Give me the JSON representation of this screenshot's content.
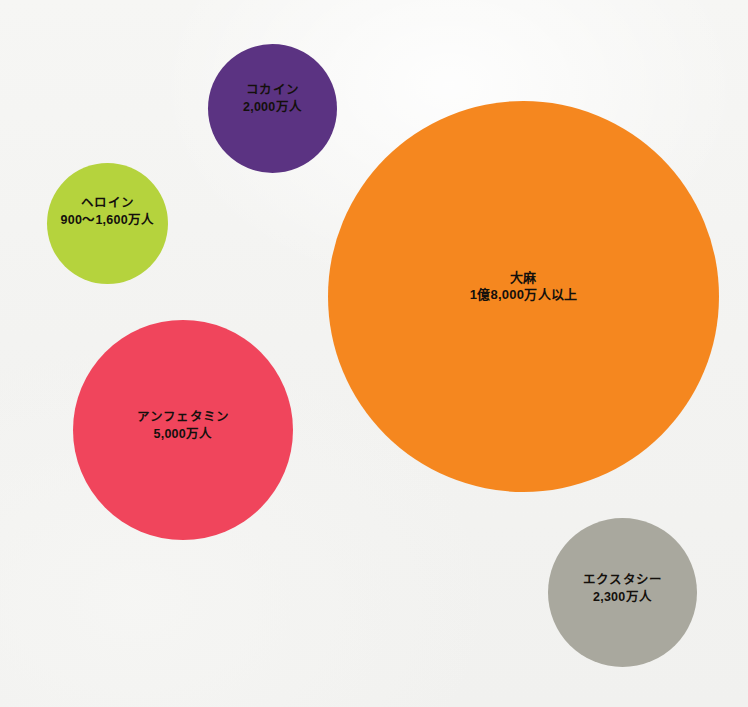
{
  "background_color": "#f4f4f2",
  "text_color": "#14100c",
  "chart_data": {
    "type": "scatter",
    "subtype": "bubble",
    "title": "",
    "subtitle": "",
    "xlabel": "",
    "ylabel": "",
    "grid": false,
    "legend": "none",
    "axis_visible": false,
    "unit_note": "万人 = 10,000 people; 億 = 100,000,000",
    "categories": [
      "コカイン",
      "ヘロイン",
      "大麻",
      "アンフェタミン",
      "エクスタシー"
    ],
    "values": [
      20000000,
      12500000,
      180000000,
      50000000,
      23000000
    ],
    "value_labels": [
      "2,000万人",
      "900～1,600万人",
      "1億8,000万人以上",
      "5,000万人",
      "2,300万人"
    ],
    "series": [
      {
        "name": "推計使用者数",
        "points": [
          {
            "label": "コカイン",
            "value_label": "2,000万人",
            "value": 20000000,
            "color": "#5b3382",
            "cx": 272,
            "cy": 108,
            "r": 64
          },
          {
            "label": "ヘロイン",
            "value_label": "900～1,600万人",
            "value_min": 9000000,
            "value_max": 16000000,
            "color": "#b5d33d",
            "cx": 108,
            "cy": 223,
            "r": 60
          },
          {
            "label": "大麻",
            "value_label": "1億8,000万人以上",
            "value": 180000000,
            "color": "#f5871f",
            "cx": 524,
            "cy": 296,
            "r": 195
          },
          {
            "label": "アンフェタミン",
            "value_label": "5,000万人",
            "value": 50000000,
            "color": "#f0455c",
            "cx": 183,
            "cy": 430,
            "r": 110
          },
          {
            "label": "エクスタシー",
            "value_label": "2,300万人",
            "value": 23000000,
            "color": "#a9a89e",
            "cx": 622,
            "cy": 592,
            "r": 74
          }
        ]
      }
    ]
  },
  "bubbles": {
    "cocaine": {
      "label": "コカイン",
      "value_label": "2,000万人",
      "color": "#5b3382"
    },
    "heroin": {
      "label": "ヘロイン",
      "value_label": "900～1,600万人",
      "color": "#b5d33d"
    },
    "cannabis": {
      "label": "大麻",
      "value_label": "1億8,000万人以上",
      "color": "#f5871f"
    },
    "amphetamine": {
      "label": "アンフェタミン",
      "value_label": "5,000万人",
      "color": "#f0455c"
    },
    "ecstasy": {
      "label": "エクスタシー",
      "value_label": "2,300万人",
      "color": "#a9a89e"
    }
  }
}
